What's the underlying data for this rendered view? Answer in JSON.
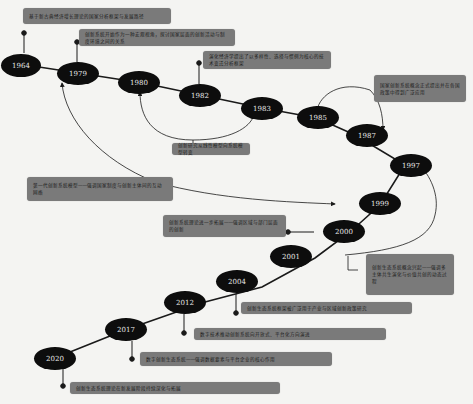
{
  "diagram": {
    "type": "timeline",
    "colors": {
      "background": "#f4f4f2",
      "node_fill": "#0d0d0d",
      "node_text": "#e8e8e8",
      "callout_fill": "#7a7a7a",
      "line": "#1a1a1a"
    },
    "nodes": [
      {
        "id": "n1964",
        "label": "1964"
      },
      {
        "id": "n1979",
        "label": "1979"
      },
      {
        "id": "n1980",
        "label": "1980"
      },
      {
        "id": "n1982",
        "label": "1982"
      },
      {
        "id": "n1983",
        "label": "1983"
      },
      {
        "id": "n1985",
        "label": "1985"
      },
      {
        "id": "n1987",
        "label": "1987"
      },
      {
        "id": "n1997",
        "label": "1997"
      },
      {
        "id": "n1999",
        "label": "1999"
      },
      {
        "id": "n2000",
        "label": "2000"
      },
      {
        "id": "n2001",
        "label": "2001"
      },
      {
        "id": "n2004",
        "label": "2004"
      },
      {
        "id": "n2012",
        "label": "2012"
      },
      {
        "id": "n2017",
        "label": "2017"
      },
      {
        "id": "n2020",
        "label": "2020"
      }
    ],
    "callouts": [
      {
        "id": "c1964",
        "text": "基于新古典经济增长理论的国家分析框架与发展路径"
      },
      {
        "id": "c1979",
        "text": "创新系统开始作为一种宏观视角，探讨国家层面的创新活动与制度环境之间的关系"
      },
      {
        "id": "c1982",
        "text": "演化经济学提出了以多样性、选择与惯例为核心的技术变迁分析框架"
      },
      {
        "id": "c1980_1983",
        "text": "创新研究从线性模型向系统模型转变"
      },
      {
        "id": "c1985_1987",
        "text": "国家创新系统概念正式提出并在各国政策中得到广泛应用"
      },
      {
        "id": "c1979_1999",
        "text": "第一代创新系统模型——强调国家制度与创新主体间的互动网络"
      },
      {
        "id": "c2000",
        "text": "创新系统理论进一步拓展——强调区域与部门层面的创新"
      },
      {
        "id": "c2001_1997",
        "text": "创新生态系统概念兴起——强调多主体共生演化与价值共创的动态过程"
      },
      {
        "id": "c2004",
        "text": "创新生态系统框架被广泛用于产业与区域创新政策研究"
      },
      {
        "id": "c2012",
        "text": "数字技术推动创新系统向开放式、平台化方向演进"
      },
      {
        "id": "c2017",
        "text": "数字创新生态系统——强调数据要素与平台企业的核心作用"
      },
      {
        "id": "c2020",
        "text": "创新生态系统理论在新发展阶段持续深化与拓展"
      }
    ]
  }
}
